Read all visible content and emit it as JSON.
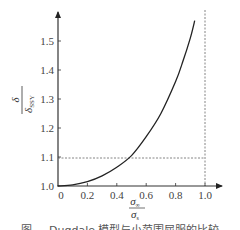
{
  "chart_data": {
    "type": "line",
    "title": "",
    "xlabel": "σ∞ / σs",
    "ylabel": "δ / δSSY",
    "xlim": [
      0,
      1.1
    ],
    "ylim": [
      1.0,
      1.6
    ],
    "x_ticks": [
      "0",
      "0.2",
      "0.4",
      "0.6",
      "0.8",
      "1.0"
    ],
    "y_ticks": [
      "1.0",
      "1.1",
      "1.2",
      "1.3",
      "1.4",
      "1.5"
    ],
    "grid": false,
    "legend": null,
    "series": [
      {
        "name": "δ/δSSY",
        "x": [
          0.0,
          0.1,
          0.2,
          0.3,
          0.4,
          0.5,
          0.6,
          0.7,
          0.8,
          0.85,
          0.9,
          0.93
        ],
        "values": [
          1.0,
          1.004,
          1.015,
          1.035,
          1.065,
          1.105,
          1.17,
          1.25,
          1.36,
          1.43,
          1.51,
          1.57
        ]
      }
    ],
    "reference_lines": [
      {
        "type": "horizontal",
        "y": 1.1,
        "x_range": [
          0,
          1.0
        ],
        "style": "dashed"
      },
      {
        "type": "vertical",
        "x": 1.0,
        "style": "dashed"
      }
    ]
  },
  "labels": {
    "y_num": "δ",
    "y_den": "δ",
    "y_den_sub": "SSY",
    "x_num": "σ",
    "x_num_sub": "∞",
    "x_den": "σ",
    "x_den_sub": "s",
    "origin_y": "1.0",
    "origin_x": "0"
  },
  "caption": "图  ...  Dugdale 模型与小范围屈服的比较"
}
